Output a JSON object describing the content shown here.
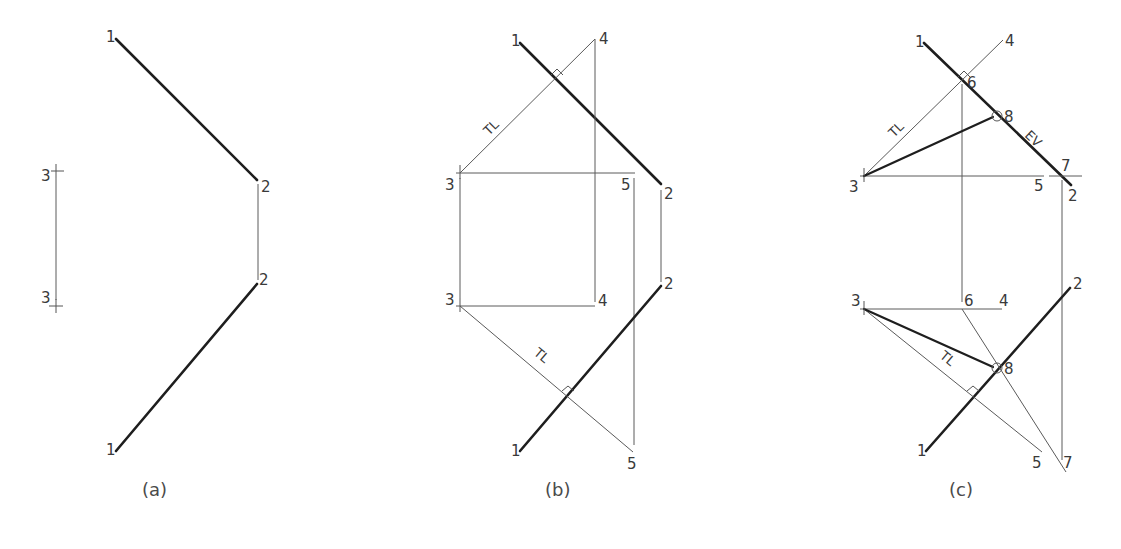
{
  "figure": {
    "panels": [
      {
        "id": "a",
        "caption": "(a)",
        "labels": {
          "p1_top": "1",
          "p2_top": "2",
          "p2_bot": "2",
          "p1_bot": "1",
          "p3_top": "3",
          "p3_bot": "3"
        }
      },
      {
        "id": "b",
        "caption": "(b)",
        "labels": {
          "p1_top": "1",
          "p4_top": "4",
          "p3_top": "3",
          "p5_top": "5",
          "p2_top": "2",
          "p3_bot": "3",
          "p4_bot": "4",
          "p2_bot": "2",
          "p1_bot": "1",
          "p5_bot": "5",
          "tl_top": "TL",
          "tl_bot": "TL"
        }
      },
      {
        "id": "c",
        "caption": "(c)",
        "labels": {
          "p1_top": "1",
          "p4_top": "4",
          "p6_top": "6",
          "p8_top": "8",
          "ev": "EV",
          "p7_top": "7",
          "p3_top": "3",
          "p5_top": "5",
          "p2_top": "2",
          "p3_bot": "3",
          "p6_bot": "6",
          "p4_bot": "4",
          "p2_bot": "2",
          "p8_bot": "8",
          "p1_bot": "1",
          "p5_bot": "5",
          "p7_bot": "7",
          "tl_top": "TL",
          "tl_bot": "TL"
        }
      }
    ],
    "colors": {
      "background": "#ffffff",
      "heavy_line": "#1e1e1e",
      "thin_line": "#5a5a5a",
      "text": "#3a3a3a"
    }
  }
}
